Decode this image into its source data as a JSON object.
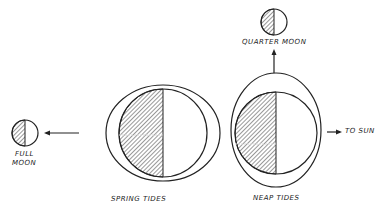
{
  "labels": {
    "full_moon_line1": "FULL",
    "full_moon_line2": "MOON",
    "quarter_moon": "QUARTER MOON",
    "spring_tides": "SPRING TIDES",
    "neap_tides": "NEAP TIDES",
    "to_sun": "TO SUN"
  },
  "colors": {
    "ink": "#222222",
    "background": "#ffffff"
  }
}
